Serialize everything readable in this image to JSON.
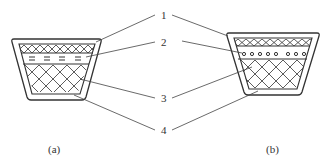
{
  "diagram": {
    "type": "V-belt cross-section comparison",
    "callouts": [
      {
        "number": "1",
        "x": 161,
        "y": 10
      },
      {
        "number": "2",
        "x": 161,
        "y": 37
      },
      {
        "number": "3",
        "x": 161,
        "y": 94
      },
      {
        "number": "4",
        "x": 161,
        "y": 128
      }
    ],
    "panels": [
      {
        "id": "a",
        "caption": "(a)",
        "tension_layer": "cord fabric (dashes)"
      },
      {
        "id": "b",
        "caption": "(b)",
        "tension_layer": "cord strands (circles)"
      }
    ],
    "colors": {
      "line": "#333333",
      "background": "#ffffff"
    }
  }
}
